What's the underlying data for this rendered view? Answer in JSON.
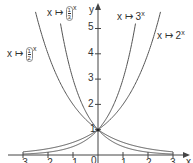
{
  "chart_data": {
    "type": "line",
    "title": "",
    "xlabel": "x",
    "ylabel": "y",
    "xlim": [
      -3.5,
      3.5
    ],
    "ylim": [
      0,
      5.6
    ],
    "x_ticks": [
      -3,
      -2,
      -1,
      0,
      1,
      2,
      3
    ],
    "y_ticks": [
      1,
      2,
      3,
      4,
      5
    ],
    "grid": false,
    "series": [
      {
        "name": "x ↦ 2^x",
        "base": 2,
        "x": [
          -3,
          -2,
          -1,
          0,
          1,
          2,
          2.5
        ],
        "values": [
          0.125,
          0.25,
          0.5,
          1,
          2,
          4,
          5.66
        ]
      },
      {
        "name": "x ↦ 3^x",
        "base": 3,
        "x": [
          -3,
          -2,
          -1,
          0,
          1,
          1.5
        ],
        "values": [
          0.037,
          0.111,
          0.333,
          1,
          3,
          5.2
        ]
      },
      {
        "name": "x ↦ (1/2)^x",
        "base": 0.5,
        "x": [
          -2.5,
          -2,
          -1,
          0,
          1,
          2,
          3
        ],
        "values": [
          5.66,
          4,
          2,
          1,
          0.5,
          0.25,
          0.125
        ]
      },
      {
        "name": "x ↦ (1/3)^x",
        "base": 0.3333,
        "x": [
          -1.5,
          -1,
          0,
          1,
          2,
          3
        ],
        "values": [
          5.2,
          3,
          1,
          0.333,
          0.111,
          0.037
        ]
      }
    ],
    "annotations": [
      "common point (0, 1)"
    ]
  },
  "labels": {
    "axis_x": "x",
    "axis_y": "y",
    "origin": "0",
    "point_one": "1",
    "f_half_prefix": "x ↦",
    "f_half_num": "1",
    "f_half_den": "2",
    "f_third_prefix": "x ↦",
    "f_third_num": "1",
    "f_third_den": "3",
    "f_three": "x ↦ 3",
    "f_two": "x ↦ 2",
    "exp": "x"
  },
  "ticks": {
    "x": [
      "-3",
      "-2",
      "-1",
      "1",
      "2",
      "3"
    ],
    "y": [
      "1",
      "2",
      "3",
      "4",
      "5"
    ]
  }
}
